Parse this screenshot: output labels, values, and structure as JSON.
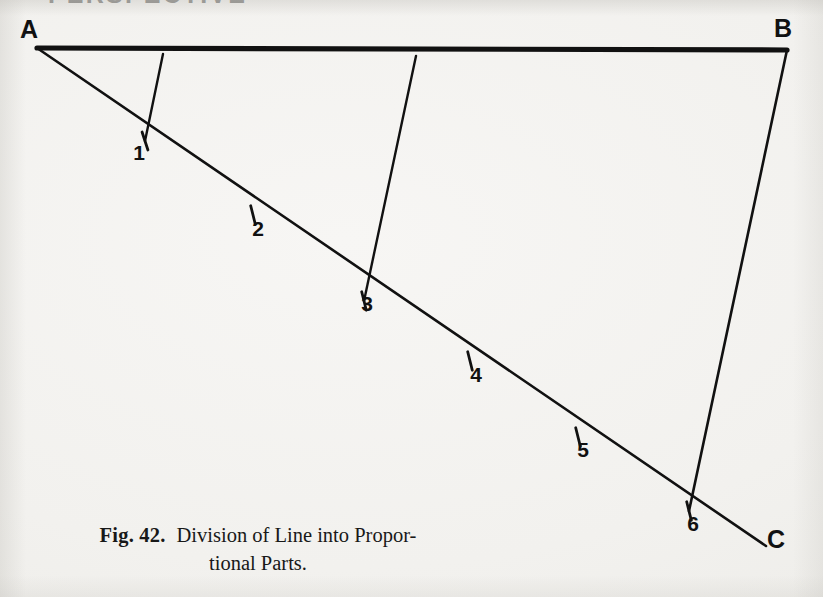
{
  "page": {
    "background_color": "#f3f2f0",
    "ink_color": "#111111",
    "width": 823,
    "height": 597
  },
  "running_header": {
    "text": "PERSPECTIVE",
    "note": "cut off at top edge of scan"
  },
  "figure": {
    "number_label": "Fig. 42.",
    "caption_line_1": "Division of Line into Propor-",
    "caption_line_2": "tional Parts.",
    "caption_full": "Fig. 42.  Division of Line into Proportional Parts.",
    "vertex_labels": {
      "a": "A",
      "b": "B",
      "c": "C"
    },
    "division_labels": [
      "1",
      "2",
      "3",
      "4",
      "5",
      "6"
    ]
  },
  "chart_data": {
    "type": "diagram",
    "lines": [
      {
        "name": "AB",
        "label_from": "A",
        "label_to": "B",
        "x1": 37,
        "y1": 48,
        "x2": 787,
        "y2": 50,
        "stroke_width": 5.2,
        "role": "line-to-divide"
      },
      {
        "name": "AC",
        "label_from": "A",
        "label_to": "C",
        "x1": 37,
        "y1": 48,
        "x2": 766,
        "y2": 546,
        "stroke_width": 2.6,
        "role": "oblique-measuring-line"
      }
    ],
    "transversals": [
      {
        "name": "transversal-1",
        "x1": 163,
        "y1": 54,
        "x2": 145,
        "y2": 141,
        "to_point": "1",
        "stroke_width": 2.4
      },
      {
        "name": "transversal-3",
        "x1": 416,
        "y1": 56,
        "x2": 364,
        "y2": 301,
        "to_point": "3",
        "stroke_width": 2.4
      },
      {
        "name": "transversal-6",
        "x1": 787,
        "y1": 50,
        "x2": 689,
        "y2": 511,
        "to_point": "6",
        "stroke_width": 2.6
      }
    ],
    "division_points": [
      {
        "label": "1",
        "x": 145,
        "y": 141,
        "label_x": 139,
        "label_y": 160,
        "tick_angle": -18
      },
      {
        "label": "2",
        "x": 253,
        "y": 215,
        "label_x": 258,
        "label_y": 236,
        "tick_angle": -14
      },
      {
        "label": "3",
        "x": 364,
        "y": 301,
        "label_x": 367,
        "label_y": 311,
        "tick_angle": -14
      },
      {
        "label": "4",
        "x": 470,
        "y": 361,
        "label_x": 476,
        "label_y": 382,
        "tick_angle": -14
      },
      {
        "label": "5",
        "x": 578,
        "y": 437,
        "label_x": 583,
        "label_y": 457,
        "tick_angle": -14
      },
      {
        "label": "6",
        "x": 689,
        "y": 511,
        "label_x": 693,
        "label_y": 531,
        "tick_angle": -14
      }
    ],
    "vertex_label_positions": [
      {
        "label": "A",
        "x": 29,
        "y": 38
      },
      {
        "label": "B",
        "x": 783,
        "y": 37
      },
      {
        "label": "C",
        "x": 776,
        "y": 548
      }
    ],
    "xlabel": "",
    "ylabel": "",
    "grid": false,
    "legend": false
  }
}
